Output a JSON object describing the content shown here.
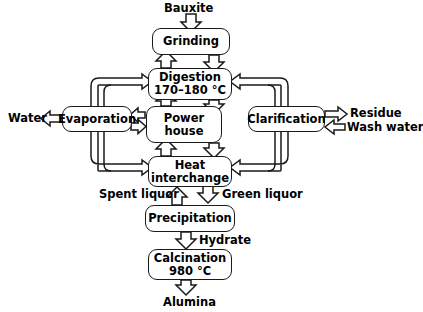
{
  "diagram": {
    "type": "process-flow",
    "stroke_color": "#1a1a1a",
    "background_color": "#ffffff",
    "nodes": [
      {
        "id": "grinding",
        "label_line1": "Grinding",
        "label_line2": ""
      },
      {
        "id": "digestion",
        "label_line1": "Digestion",
        "label_line2": "170–180 °C"
      },
      {
        "id": "evaporation",
        "label_line1": "Evaporation",
        "label_line2": ""
      },
      {
        "id": "powerhouse",
        "label_line1": "Power",
        "label_line2": "house"
      },
      {
        "id": "clarification",
        "label_line1": "Clarification",
        "label_line2": ""
      },
      {
        "id": "heat",
        "label_line1": "Heat",
        "label_line2": "interchange"
      },
      {
        "id": "precipitation",
        "label_line1": "Precipitation",
        "label_line2": ""
      },
      {
        "id": "calcination",
        "label_line1": "Calcination",
        "label_line2": "980 °C"
      }
    ],
    "stream_labels": [
      {
        "id": "bauxite",
        "text": "Bauxite"
      },
      {
        "id": "water",
        "text": "Water"
      },
      {
        "id": "residue",
        "text": "Residue"
      },
      {
        "id": "wash-water",
        "text": "Wash water"
      },
      {
        "id": "spent-liquor",
        "text": "Spent liquor"
      },
      {
        "id": "green-liquor",
        "text": "Green liquor"
      },
      {
        "id": "hydrate",
        "text": "Hydrate"
      },
      {
        "id": "alumina",
        "text": "Alumina"
      }
    ],
    "flows": [
      {
        "from": "bauxite",
        "to": "grinding",
        "direction": "down"
      },
      {
        "from": "grinding",
        "to": "digestion",
        "direction": "down"
      },
      {
        "from": "digestion",
        "to": "grinding",
        "direction": "up"
      },
      {
        "from": "evaporation",
        "to": "digestion",
        "direction": "right-up"
      },
      {
        "from": "clarification",
        "to": "digestion",
        "direction": "left-up"
      },
      {
        "from": "digestion",
        "to": "powerhouse",
        "direction": "down"
      },
      {
        "from": "powerhouse",
        "to": "digestion",
        "direction": "up"
      },
      {
        "from": "powerhouse",
        "to": "evaporation",
        "direction": "left"
      },
      {
        "from": "evaporation",
        "to": "powerhouse",
        "direction": "right"
      },
      {
        "from": "evaporation",
        "to": "water",
        "direction": "left"
      },
      {
        "from": "clarification",
        "to": "residue",
        "direction": "right"
      },
      {
        "from": "wash-water",
        "to": "clarification",
        "direction": "left"
      },
      {
        "from": "powerhouse",
        "to": "heat",
        "direction": "down"
      },
      {
        "from": "heat",
        "to": "powerhouse",
        "direction": "up"
      },
      {
        "from": "evaporation",
        "to": "heat",
        "direction": "right-down"
      },
      {
        "from": "clarification",
        "to": "heat",
        "direction": "left-down"
      },
      {
        "from": "heat",
        "to": "precipitation",
        "direction": "down"
      },
      {
        "from": "precipitation",
        "to": "heat",
        "direction": "up"
      },
      {
        "from": "precipitation",
        "to": "calcination",
        "direction": "down"
      },
      {
        "from": "calcination",
        "to": "alumina",
        "direction": "down"
      }
    ]
  }
}
